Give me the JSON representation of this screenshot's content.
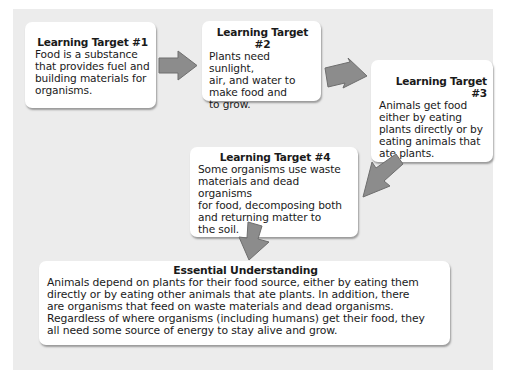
{
  "diagram": {
    "type": "flowchart",
    "background_color": "#ececec",
    "box_color": "#ffffff",
    "arrow_color": "#8c8c8c",
    "boxes": [
      {
        "id": "learning-target-1",
        "title": "Learning Target #1",
        "body": "Food is a substance\nthat provides fuel and\nbuilding materials for\norganisms."
      },
      {
        "id": "learning-target-2",
        "title": "Learning Target #2",
        "body": "Plants need sunlight,\nair, and water to\nmake food and\nto grow."
      },
      {
        "id": "learning-target-3",
        "title": "Learning Target #3",
        "body": "Animals get food\neither by eating\nplants directly or by\neating animals that\nate plants."
      },
      {
        "id": "learning-target-4",
        "title": "Learning Target #4",
        "body": "Some organisms use waste\nmaterials and dead organisms\nfor food, decomposing both\nand returning matter to\nthe soil."
      },
      {
        "id": "essential-understanding",
        "title": "Essential Understanding",
        "body": "Animals depend on plants for their food source, either by eating them\ndirectly or by eating other animals that ate plants. In addition, there\nare organisms that feed on waste materials and dead organisms.\nRegardless of where organisms (including humans) get their food, they\nall need some source of energy to stay alive and grow."
      }
    ],
    "arrows": [
      {
        "from": "learning-target-1",
        "to": "learning-target-2",
        "direction": "right"
      },
      {
        "from": "learning-target-2",
        "to": "learning-target-3",
        "direction": "down-right"
      },
      {
        "from": "learning-target-3",
        "to": "learning-target-4",
        "direction": "down-left"
      },
      {
        "from": "learning-target-4",
        "to": "essential-understanding",
        "direction": "down"
      }
    ]
  }
}
